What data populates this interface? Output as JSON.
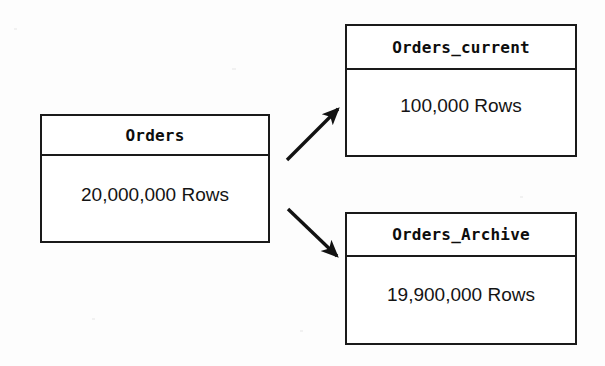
{
  "diagram": {
    "background_color": "#ffffff",
    "line_color": "#1a1a1a",
    "shadow_color": "#c9c9c9",
    "entities": [
      {
        "id": "orders",
        "header": "Orders",
        "body": "20,000,000 Rows",
        "row_count": 20000000
      },
      {
        "id": "orders_current",
        "header": "Orders_current",
        "body": "100,000 Rows",
        "row_count": 100000
      },
      {
        "id": "orders_archive",
        "header": "Orders_Archive",
        "body": "19,900,000 Rows",
        "row_count": 19900000
      }
    ],
    "connectors": [
      {
        "id": "orders-to-current",
        "from": "orders",
        "to": "orders_current",
        "style": "solid-arrow",
        "direction": "up-right"
      },
      {
        "id": "orders-to-archive",
        "from": "orders",
        "to": "orders_archive",
        "style": "solid-arrow",
        "direction": "down-right"
      }
    ]
  }
}
